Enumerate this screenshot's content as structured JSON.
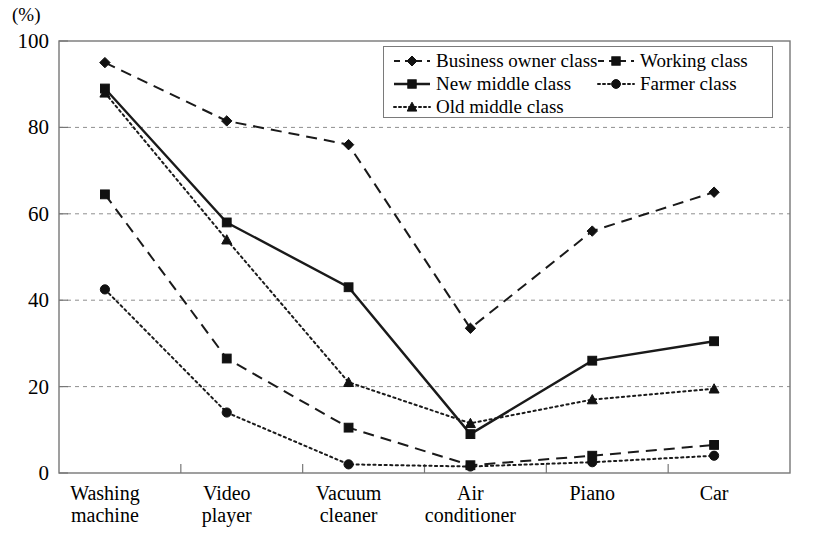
{
  "chart_data": {
    "type": "line",
    "title": "",
    "xlabel": "",
    "ylabel": "(%)",
    "ylim": [
      0,
      100
    ],
    "yticks": [
      0,
      20,
      40,
      60,
      80,
      100
    ],
    "grid": "horizontal-dashed",
    "legend_position": "top-right-inside-box",
    "categories": [
      "Washing\nmachine",
      "Video\nplayer",
      "Vacuum\ncleaner",
      "Air\nconditioner",
      "Piano",
      "Car"
    ],
    "series": [
      {
        "name": "Business owner class",
        "marker": "diamond",
        "line_style": "dashed",
        "color": "#1a1a1a",
        "values": [
          95,
          81.5,
          76,
          33.5,
          56,
          65
        ]
      },
      {
        "name": "Working class",
        "marker": "square",
        "line_style": "dashed",
        "color": "#1a1a1a",
        "values": [
          64.5,
          26.5,
          10.5,
          1.8,
          4,
          6.5
        ]
      },
      {
        "name": "New middle class",
        "marker": "square",
        "line_style": "solid",
        "color": "#1a1a1a",
        "values": [
          89,
          58,
          43,
          9,
          26,
          30.5
        ]
      },
      {
        "name": "Farmer class",
        "marker": "circle",
        "line_style": "dotted",
        "color": "#1a1a1a",
        "values": [
          42.5,
          14,
          2,
          1.5,
          2.5,
          4
        ]
      },
      {
        "name": "Old middle class",
        "marker": "triangle",
        "line_style": "dotted",
        "color": "#1a1a1a",
        "values": [
          88,
          54,
          21,
          11.5,
          17,
          19.5
        ]
      }
    ]
  },
  "axis": {
    "unit_label": "(%)",
    "ytick_labels": [
      "0",
      "20",
      "40",
      "60",
      "80",
      "100"
    ]
  },
  "legend": {
    "entries": [
      "Business owner class",
      "Working class",
      "New middle class",
      "Farmer class",
      "Old middle class"
    ]
  }
}
